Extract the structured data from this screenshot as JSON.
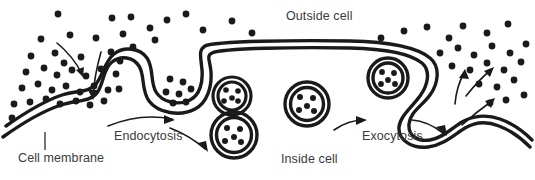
{
  "diagram": {
    "title_visible": false,
    "background_color": "#ffffff",
    "ink_color": "#1a1a1a",
    "text_color": "#3a3a3a",
    "labels": {
      "outside_cell": "Outside cell",
      "inside_cell": "Inside cell",
      "cell_membrane": "Cell membrane",
      "endocytosis": "Endocytosis",
      "exocytosis": "Exocytosis"
    },
    "label_positions": {
      "outside_cell": {
        "x": 286,
        "y": 20
      },
      "inside_cell": {
        "x": 281,
        "y": 163
      },
      "cell_membrane": {
        "x": 18,
        "y": 162
      },
      "endocytosis": {
        "x": 114,
        "y": 140
      },
      "exocytosis": {
        "x": 362,
        "y": 140
      }
    },
    "membrane": {
      "stroke_width": 3.4,
      "gap": 7,
      "description": "double-line cell membrane with an endocytic invagination on the left and an exocytic evagination on the right"
    },
    "vesicles": [
      {
        "name": "endocytic-vesicle-upper",
        "cx": 232,
        "cy": 96,
        "r": 19,
        "dots": 5,
        "rings": 2
      },
      {
        "name": "endocytic-vesicle-lower",
        "cx": 234,
        "cy": 135,
        "r": 23,
        "dots": 5,
        "rings": 2
      },
      {
        "name": "cytoplasmic-vesicle",
        "cx": 307,
        "cy": 104,
        "r": 22,
        "dots": 5,
        "rings": 2
      },
      {
        "name": "exocytic-vesicle-fusing",
        "cx": 388,
        "cy": 78,
        "r": 20,
        "dots": 5,
        "rings": 2
      }
    ],
    "particle_counts": {
      "outside_left_cloud": 44,
      "outside_top_scatter": 11,
      "outside_right_cloud": 24,
      "inside_pit": 7
    },
    "flow_arrows": {
      "intake_count": 2,
      "endocytosis_count": 2,
      "exocytosis_count": 2,
      "release_count": 3
    }
  }
}
